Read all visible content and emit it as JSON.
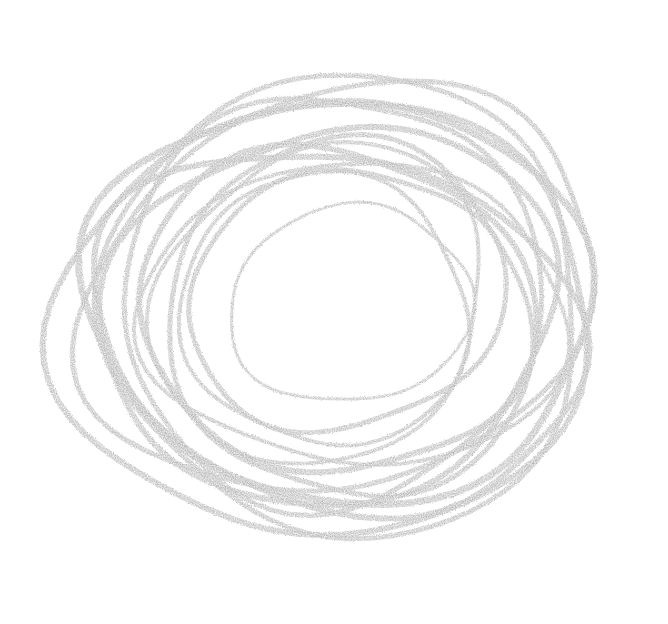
{
  "image": {
    "description": "Pencil scribble of overlapping concentric loops",
    "background_color": "#ffffff",
    "stroke_color": "#b4b4b4",
    "center": [
      334,
      318
    ],
    "loops": [
      {
        "cx": 350,
        "cy": 305,
        "rx": 122,
        "ry": 98,
        "rot": -8,
        "w": 3
      },
      {
        "cx": 345,
        "cy": 300,
        "rx": 160,
        "ry": 128,
        "rot": -12,
        "w": 5
      },
      {
        "cx": 335,
        "cy": 310,
        "rx": 200,
        "ry": 160,
        "rot": 10,
        "w": 6
      },
      {
        "cx": 330,
        "cy": 315,
        "rx": 230,
        "ry": 185,
        "rot": -15,
        "w": 6
      },
      {
        "cx": 340,
        "cy": 300,
        "rx": 255,
        "ry": 200,
        "rot": 6,
        "w": 7
      },
      {
        "cx": 325,
        "cy": 320,
        "rx": 270,
        "ry": 215,
        "rot": -5,
        "w": 6
      },
      {
        "cx": 345,
        "cy": 305,
        "rx": 240,
        "ry": 230,
        "rot": 25,
        "w": 5
      },
      {
        "cx": 330,
        "cy": 300,
        "rx": 210,
        "ry": 205,
        "rot": -30,
        "w": 5
      },
      {
        "cx": 350,
        "cy": 320,
        "rx": 185,
        "ry": 175,
        "rot": 40,
        "w": 5
      },
      {
        "cx": 320,
        "cy": 305,
        "rx": 175,
        "ry": 150,
        "rot": -40,
        "w": 4
      },
      {
        "cx": 338,
        "cy": 330,
        "rx": 250,
        "ry": 175,
        "rot": 15,
        "w": 6
      },
      {
        "cx": 340,
        "cy": 290,
        "rx": 265,
        "ry": 195,
        "rot": -20,
        "w": 5
      },
      {
        "cx": 355,
        "cy": 315,
        "rx": 215,
        "ry": 150,
        "rot": 3,
        "w": 4
      },
      {
        "cx": 325,
        "cy": 310,
        "rx": 145,
        "ry": 135,
        "rot": 20,
        "w": 4
      }
    ]
  }
}
